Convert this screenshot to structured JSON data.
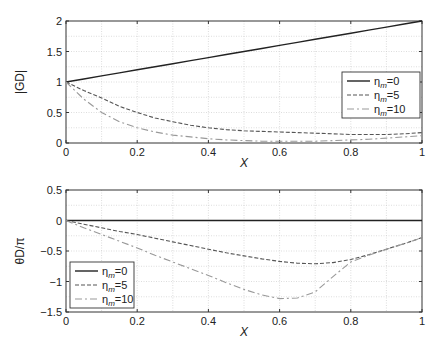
{
  "chart_data": [
    {
      "type": "line",
      "title": "",
      "xlabel": "X",
      "ylabel": "|G_D|",
      "xlim": [
        0,
        1
      ],
      "ylim": [
        0,
        2
      ],
      "grid": true,
      "legend_position": "right-middle",
      "x_ticks": [
        "0",
        "0.2",
        "0.4",
        "0.6",
        "0.8",
        "1"
      ],
      "y_ticks": [
        "0",
        "0.5",
        "1",
        "1.5",
        "2"
      ],
      "x": [
        0,
        0.05,
        0.1,
        0.15,
        0.2,
        0.25,
        0.3,
        0.35,
        0.4,
        0.45,
        0.5,
        0.55,
        0.6,
        0.65,
        0.7,
        0.75,
        0.8,
        0.85,
        0.9,
        0.95,
        1.0
      ],
      "series": [
        {
          "name": "η_m = 0",
          "style": "solid",
          "color": "#222222",
          "values": [
            1.0,
            1.05,
            1.1,
            1.15,
            1.2,
            1.25,
            1.3,
            1.35,
            1.4,
            1.45,
            1.5,
            1.55,
            1.6,
            1.65,
            1.7,
            1.75,
            1.8,
            1.85,
            1.9,
            1.95,
            2.0
          ]
        },
        {
          "name": "η_m = 5",
          "style": "dashed",
          "color": "#555555",
          "values": [
            1.0,
            0.86,
            0.74,
            0.6,
            0.5,
            0.41,
            0.35,
            0.29,
            0.25,
            0.22,
            0.2,
            0.19,
            0.18,
            0.17,
            0.16,
            0.15,
            0.14,
            0.14,
            0.14,
            0.15,
            0.17
          ]
        },
        {
          "name": "η_m = 10",
          "style": "dashdot",
          "color": "#999999",
          "values": [
            1.0,
            0.72,
            0.5,
            0.35,
            0.25,
            0.18,
            0.13,
            0.1,
            0.07,
            0.05,
            0.04,
            0.03,
            0.03,
            0.03,
            0.03,
            0.04,
            0.05,
            0.06,
            0.08,
            0.1,
            0.12
          ]
        }
      ]
    },
    {
      "type": "line",
      "title": "",
      "xlabel": "X",
      "ylabel": "θ_D/π",
      "xlim": [
        0,
        1
      ],
      "ylim": [
        -1.5,
        0.5
      ],
      "grid": true,
      "legend_position": "lower-left",
      "x_ticks": [
        "0",
        "0.2",
        "0.4",
        "0.6",
        "0.8",
        "1"
      ],
      "y_ticks": [
        "-1.5",
        "-1",
        "-0.5",
        "0",
        "0.5"
      ],
      "x": [
        0,
        0.05,
        0.1,
        0.15,
        0.2,
        0.25,
        0.3,
        0.35,
        0.4,
        0.45,
        0.5,
        0.55,
        0.6,
        0.65,
        0.7,
        0.75,
        0.8,
        0.85,
        0.9,
        0.95,
        1.0
      ],
      "series": [
        {
          "name": "η_m = 0",
          "style": "solid",
          "color": "#222222",
          "values": [
            0,
            0,
            0,
            0,
            0,
            0,
            0,
            0,
            0,
            0,
            0,
            0,
            0,
            0,
            0,
            0,
            0,
            0,
            0,
            0,
            0
          ]
        },
        {
          "name": "η_m = 5",
          "style": "dashed",
          "color": "#555555",
          "values": [
            0,
            -0.06,
            -0.12,
            -0.18,
            -0.23,
            -0.29,
            -0.35,
            -0.41,
            -0.47,
            -0.53,
            -0.58,
            -0.63,
            -0.67,
            -0.7,
            -0.71,
            -0.69,
            -0.64,
            -0.56,
            -0.47,
            -0.38,
            -0.28
          ]
        },
        {
          "name": "η_m = 10",
          "style": "dashdot",
          "color": "#999999",
          "values": [
            0,
            -0.12,
            -0.23,
            -0.34,
            -0.45,
            -0.57,
            -0.68,
            -0.79,
            -0.9,
            -1.02,
            -1.13,
            -1.22,
            -1.28,
            -1.27,
            -1.17,
            -0.92,
            -0.68,
            -0.57,
            -0.47,
            -0.38,
            -0.28
          ]
        }
      ]
    }
  ]
}
